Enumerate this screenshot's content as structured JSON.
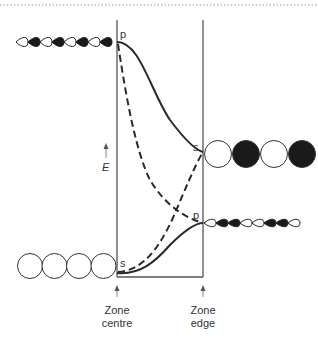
{
  "diagram": {
    "type": "band-structure-orbital-diagram",
    "energy_axis_label": "E",
    "zone_centre": {
      "line1": "Zone",
      "line2": "centre"
    },
    "zone_edge": {
      "line1": "Zone",
      "line2": "edge"
    },
    "labels": {
      "centre_top": "p",
      "centre_bottom": "s",
      "edge_upper": "s",
      "edge_lower": "p"
    },
    "bands": [
      {
        "name": "p-band",
        "style": "solid",
        "from": "p (zone centre, high)",
        "to": "s (zone edge, middle)"
      },
      {
        "name": "s-band",
        "style": "solid",
        "from": "s (zone centre, low)",
        "to": "p (zone edge, lower-middle)"
      },
      {
        "name": "p-band-unmixed",
        "style": "dashed",
        "from": "p (zone centre, high)",
        "to": "p (zone edge)"
      },
      {
        "name": "s-band-unmixed",
        "style": "dashed",
        "from": "s (zone centre, low)",
        "to": "s (zone edge)"
      }
    ],
    "orbital_chains": {
      "centre_p": {
        "orbital": "p",
        "lobes": 8,
        "phase_pattern": "in-phase"
      },
      "centre_s": {
        "orbital": "s",
        "circles": 4,
        "fills": [
          "white",
          "white",
          "white",
          "white"
        ]
      },
      "edge_s": {
        "orbital": "s",
        "circles": 4,
        "fills": [
          "white",
          "black",
          "white",
          "black"
        ]
      },
      "edge_p": {
        "orbital": "p",
        "lobes": 8,
        "phase_pattern": "alternating"
      }
    },
    "colors": {
      "line": "#2a2a2a",
      "fill_dark": "#1a1a1a",
      "fill_light": "#ffffff",
      "frame": "#555555",
      "dotted_rule": "#999999"
    }
  }
}
